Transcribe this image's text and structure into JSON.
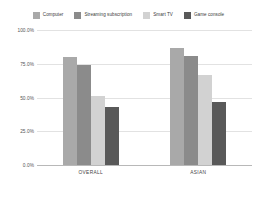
{
  "chart_data": {
    "type": "bar",
    "title": "",
    "subtitle": "",
    "xlabel": "",
    "ylabel": "",
    "categories": [
      "OVERALL",
      "ASIAN"
    ],
    "series": [
      {
        "name": "Computer",
        "color": "#a9a9a9",
        "values": [
          80.0,
          87.0
        ]
      },
      {
        "name": "Streaming subscription",
        "color": "#8b8b8b",
        "values": [
          74.0,
          81.0
        ]
      },
      {
        "name": "Smart TV",
        "color": "#d2d2d2",
        "values": [
          51.0,
          67.0
        ]
      },
      {
        "name": "Game console",
        "color": "#595959",
        "values": [
          43.0,
          47.0
        ]
      }
    ],
    "ylim": [
      0,
      100
    ],
    "y_ticks": [
      100.0,
      75.0,
      50.0,
      25.0,
      0.0
    ],
    "y_tick_labels": [
      "100.0%",
      "75.0%",
      "50.0%",
      "25.0%",
      "0.0%"
    ],
    "grid": true,
    "grid_color": "#e2e2e2",
    "baseline_color": "#b8b8b8",
    "legend_position": "top",
    "value_suffix": "%",
    "background": "#ffffff"
  }
}
